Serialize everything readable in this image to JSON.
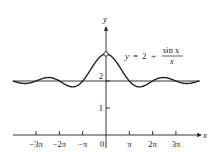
{
  "chart_data": {
    "type": "line",
    "title": "",
    "equation_label": {
      "lhs": "y",
      "equals": "=",
      "constant": "2",
      "plus": "+",
      "numerator": "sin x",
      "denominator": "x"
    },
    "xlabel": "x",
    "ylabel": "y",
    "xlim": [
      -12.566,
      12.566
    ],
    "ylim": [
      0,
      3.2
    ],
    "grid": false,
    "legend": "none",
    "x_ticks": [
      {
        "value": -9.4248,
        "label": "−3π"
      },
      {
        "value": -6.2832,
        "label": "−2π"
      },
      {
        "value": -3.1416,
        "label": "−π"
      },
      {
        "value": 0,
        "label": "0"
      },
      {
        "value": 3.1416,
        "label": "π"
      },
      {
        "value": 6.2832,
        "label": "2π"
      },
      {
        "value": 9.4248,
        "label": "3π"
      }
    ],
    "y_ticks": [
      {
        "value": 1,
        "label": "1"
      },
      {
        "value": 2,
        "label": "2"
      }
    ],
    "series": [
      {
        "name": "y = 2 + sin x / x",
        "function": "2 + sin(x)/x",
        "color": "#222222",
        "hole_at": [
          0,
          3
        ]
      },
      {
        "name": "asymptote y = 2",
        "function": "2",
        "color": "#222222"
      }
    ],
    "sample_points": [
      {
        "x": -12.566,
        "y": 2.0
      },
      {
        "x": -10.996,
        "y": 1.909
      },
      {
        "x": -7.854,
        "y": 2.127
      },
      {
        "x": -4.493,
        "y": 1.783
      },
      {
        "x": -3.1416,
        "y": 2.0
      },
      {
        "x": -1.5708,
        "y": 2.637
      },
      {
        "x": 0,
        "y": 3.0
      },
      {
        "x": 1.5708,
        "y": 2.637
      },
      {
        "x": 3.1416,
        "y": 2.0
      },
      {
        "x": 4.493,
        "y": 1.783
      },
      {
        "x": 7.854,
        "y": 2.127
      },
      {
        "x": 10.996,
        "y": 1.909
      },
      {
        "x": 12.566,
        "y": 2.0
      }
    ]
  }
}
